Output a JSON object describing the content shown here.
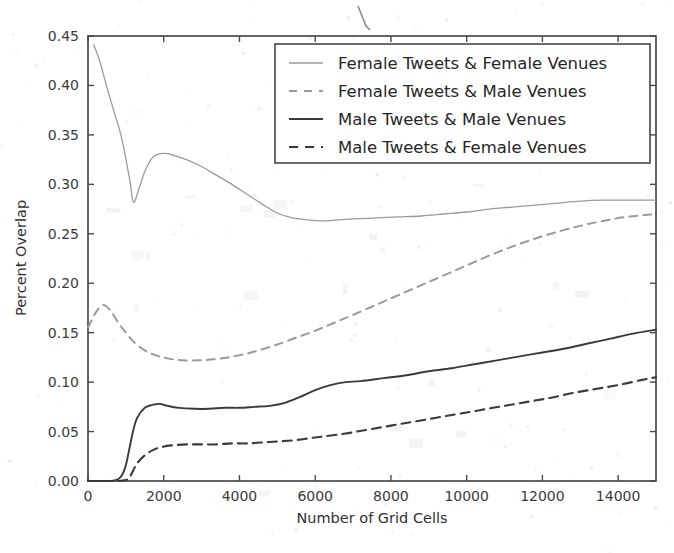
{
  "chart_data": {
    "type": "line",
    "title": "",
    "xlabel": "Number of Grid Cells",
    "ylabel": "Percent Overlap",
    "xlim": [
      0,
      15000
    ],
    "ylim": [
      0.0,
      0.45
    ],
    "grid": false,
    "legend_position": "upper right",
    "xticks": [
      0,
      2000,
      4000,
      6000,
      8000,
      10000,
      12000,
      14000
    ],
    "xtick_labels": [
      "0",
      "2000",
      "4000",
      "6000",
      "8000",
      "10000",
      "12000",
      "14000"
    ],
    "yticks": [
      0.0,
      0.05,
      0.1,
      0.15,
      0.2,
      0.25,
      0.3,
      0.35,
      0.4,
      0.45
    ],
    "ytick_labels": [
      "0.00",
      "0.05",
      "0.10",
      "0.15",
      "0.20",
      "0.25",
      "0.30",
      "0.35",
      "0.40",
      "0.45"
    ],
    "series": [
      {
        "name": "Female Tweets & Female Venues",
        "style": "solid",
        "color": "#9a9a9a",
        "width": 1.3,
        "x": [
          150,
          300,
          500,
          700,
          900,
          1100,
          1200,
          1350,
          1500,
          1700,
          1900,
          2100,
          2300,
          2600,
          3000,
          3400,
          3800,
          4200,
          4600,
          5000,
          5400,
          5800,
          6200,
          6600,
          7000,
          7600,
          8200,
          8800,
          9400,
          10000,
          10600,
          11200,
          11800,
          12400,
          13000,
          13600,
          14200,
          14700,
          15000
        ],
        "y": [
          0.441,
          0.426,
          0.398,
          0.372,
          0.345,
          0.305,
          0.282,
          0.296,
          0.313,
          0.327,
          0.331,
          0.331,
          0.329,
          0.325,
          0.318,
          0.309,
          0.3,
          0.29,
          0.28,
          0.271,
          0.266,
          0.264,
          0.263,
          0.264,
          0.265,
          0.266,
          0.267,
          0.268,
          0.27,
          0.272,
          0.275,
          0.277,
          0.279,
          0.281,
          0.283,
          0.284,
          0.284,
          0.284,
          0.284
        ]
      },
      {
        "name": "Female Tweets & Male Venues",
        "style": "dashed",
        "color": "#9a9a9a",
        "width": 2.0,
        "x": [
          0,
          200,
          400,
          600,
          800,
          1000,
          1200,
          1500,
          1800,
          2100,
          2500,
          2900,
          3300,
          3700,
          4100,
          4500,
          5000,
          5500,
          6000,
          6500,
          7000,
          7600,
          8200,
          8800,
          9400,
          10000,
          10600,
          11200,
          11800,
          12400,
          13000,
          13600,
          14200,
          14700,
          15000
        ],
        "y": [
          0.155,
          0.17,
          0.178,
          0.172,
          0.16,
          0.15,
          0.141,
          0.132,
          0.127,
          0.124,
          0.122,
          0.122,
          0.123,
          0.125,
          0.128,
          0.132,
          0.138,
          0.145,
          0.152,
          0.16,
          0.168,
          0.178,
          0.188,
          0.198,
          0.208,
          0.218,
          0.228,
          0.237,
          0.245,
          0.252,
          0.258,
          0.263,
          0.267,
          0.269,
          0.27
        ]
      },
      {
        "name": "Male Tweets & Male Venues",
        "style": "solid",
        "color": "#3a3a3a",
        "width": 1.9,
        "x": [
          0,
          300,
          600,
          800,
          900,
          1000,
          1100,
          1200,
          1300,
          1500,
          1700,
          1900,
          2100,
          2400,
          2800,
          3200,
          3600,
          4000,
          4400,
          4800,
          5200,
          5600,
          6000,
          6400,
          6800,
          7200,
          7800,
          8400,
          9000,
          9600,
          10200,
          10800,
          11400,
          12000,
          12600,
          13200,
          13800,
          14400,
          15000
        ],
        "y": [
          0.0,
          0.0,
          0.0,
          0.002,
          0.006,
          0.016,
          0.034,
          0.052,
          0.064,
          0.074,
          0.077,
          0.078,
          0.076,
          0.074,
          0.073,
          0.073,
          0.074,
          0.074,
          0.075,
          0.076,
          0.079,
          0.085,
          0.092,
          0.097,
          0.1,
          0.101,
          0.104,
          0.107,
          0.111,
          0.114,
          0.118,
          0.122,
          0.126,
          0.13,
          0.134,
          0.139,
          0.144,
          0.149,
          0.153
        ]
      },
      {
        "name": "Male Tweets & Female Venues",
        "style": "dashed",
        "color": "#3a3a3a",
        "width": 2.1,
        "x": [
          0,
          400,
          800,
          1000,
          1100,
          1200,
          1300,
          1500,
          1700,
          1900,
          2200,
          2600,
          3000,
          3400,
          3800,
          4200,
          4600,
          5000,
          5400,
          5800,
          6200,
          6800,
          7400,
          8000,
          8600,
          9200,
          9800,
          10400,
          11000,
          11600,
          12200,
          12800,
          13400,
          14000,
          14600,
          15000
        ],
        "y": [
          0.0,
          0.0,
          0.0,
          0.001,
          0.004,
          0.011,
          0.018,
          0.026,
          0.031,
          0.034,
          0.036,
          0.037,
          0.037,
          0.037,
          0.038,
          0.038,
          0.039,
          0.04,
          0.041,
          0.043,
          0.045,
          0.048,
          0.052,
          0.056,
          0.06,
          0.064,
          0.068,
          0.072,
          0.076,
          0.08,
          0.084,
          0.089,
          0.093,
          0.097,
          0.102,
          0.105
        ]
      }
    ]
  }
}
